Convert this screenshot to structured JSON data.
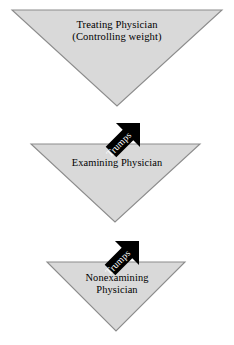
{
  "diagram": {
    "background_color": "#ffffff",
    "triangle_fill": "#d9d9d9",
    "triangle_stroke": "#808080",
    "arrow_fill": "#000000",
    "arrow_label_color": "#ffffff",
    "nodes": [
      {
        "id": "treating-physician",
        "shape": "inverted-triangle",
        "line1": "Treating Physician",
        "line2": "(Controlling weight)"
      },
      {
        "id": "examining-physician",
        "shape": "inverted-triangle",
        "line1": "Examining Physician",
        "line2": ""
      },
      {
        "id": "nonexamining-physician",
        "shape": "inverted-triangle",
        "line1": "Nonexamining",
        "line2": "Physician"
      }
    ],
    "connectors": [
      {
        "id": "arrow-treating-to-examining",
        "label": "Trumps",
        "direction": "down-left"
      },
      {
        "id": "arrow-examining-to-nonexamining",
        "label": "Trumps",
        "direction": "down-left"
      }
    ]
  }
}
